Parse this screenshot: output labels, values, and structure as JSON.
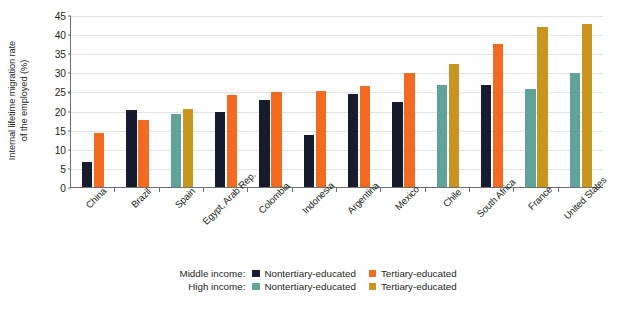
{
  "chart_data": {
    "type": "bar",
    "title": "",
    "xlabel": "",
    "ylabel": "Internal lifetime migration rate of the employed (%)",
    "ylabel_line1": "Internal lifetime migration rate",
    "ylabel_line2": "of the employed (%)",
    "ylim": [
      0,
      45
    ],
    "ytick_step": 5,
    "yticks": [
      "45",
      "40",
      "35",
      "30",
      "25",
      "20",
      "15",
      "10",
      "5",
      "0"
    ],
    "grid": true,
    "grid_axis": "y",
    "legend_position": "bottom",
    "categories": [
      "China",
      "Brazil",
      "Spain",
      "Egypt, Arab Rep.",
      "Colombia",
      "Indonesia",
      "Argentina",
      "Mexico",
      "Chile",
      "South Africa",
      "France",
      "United States"
    ],
    "category_income_group": [
      "Middle income",
      "Middle income",
      "High income",
      "Middle income",
      "Middle income",
      "Middle income",
      "Middle income",
      "Middle income",
      "High income",
      "Middle income",
      "High income",
      "High income"
    ],
    "series": [
      {
        "name": "Middle income: Nontertiary-educated",
        "color": "#161b2e",
        "values": [
          6.7,
          20.4,
          null,
          19.9,
          22.9,
          13.9,
          24.6,
          22.6,
          null,
          27.0,
          null,
          null
        ]
      },
      {
        "name": "Middle income: Tertiary-educated",
        "color": "#f26b21",
        "values": [
          14.3,
          17.9,
          null,
          24.4,
          25.1,
          25.5,
          26.8,
          30.2,
          null,
          37.8,
          null,
          null
        ]
      },
      {
        "name": "High income: Nontertiary-educated",
        "color": "#5fa399",
        "values": [
          null,
          null,
          19.4,
          null,
          null,
          null,
          null,
          null,
          27.0,
          null,
          26.0,
          30.1
        ]
      },
      {
        "name": "High income: Tertiary-educated",
        "color": "#c8961e",
        "values": [
          null,
          null,
          20.8,
          null,
          null,
          null,
          null,
          null,
          32.5,
          null,
          42.0,
          43.0
        ]
      }
    ]
  },
  "legend": {
    "rows": [
      {
        "row_label": "Middle income:",
        "items": [
          {
            "label": "Nontertiary-educated",
            "color": "#161b2e"
          },
          {
            "label": "Tertiary-educated",
            "color": "#f26b21"
          }
        ]
      },
      {
        "row_label": "High income:",
        "items": [
          {
            "label": "Nontertiary-educated",
            "color": "#5fa399"
          },
          {
            "label": "Tertiary-educated",
            "color": "#c8961e"
          }
        ]
      }
    ]
  },
  "colors": {
    "middle_nontertiary": "#161b2e",
    "middle_tertiary": "#f26b21",
    "high_nontertiary": "#5fa399",
    "high_tertiary": "#c8961e",
    "axis": "#6d6e71",
    "gridline": "#e3e3e3",
    "text": "#231f20",
    "background": "#ffffff"
  }
}
